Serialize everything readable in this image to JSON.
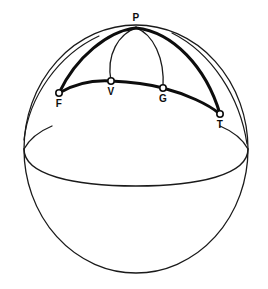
{
  "figure": {
    "type": "geometry-diagram",
    "background_color": "#ffffff",
    "stroke_color": "#1a1a1a",
    "thick_stroke_color": "#0d0d0d",
    "label_color": "#0d0d0d",
    "canvas": {
      "width": 268,
      "height": 289
    }
  },
  "sphere": {
    "center_x": 136,
    "center_y": 149,
    "radius_x": 112,
    "radius_y": 124,
    "outline_stroke_width": 1.3
  },
  "equator": {
    "name": "equator-ellipse",
    "center_x": 136,
    "center_y": 149,
    "semi_major": 112,
    "semi_minor": 36,
    "front_visible": true,
    "back_visible": "stub-only",
    "stroke_width": 1.4
  },
  "points": [
    {
      "id": "P",
      "label": "P",
      "x": 136,
      "y": 28,
      "label_x": 136,
      "label_y": 13,
      "marker": false,
      "role": "pole"
    },
    {
      "id": "F",
      "label": "F",
      "x": 59,
      "y": 93,
      "label_x": 59,
      "label_y": 99,
      "marker": true,
      "role": "vertex"
    },
    {
      "id": "V",
      "label": "V",
      "x": 111,
      "y": 81,
      "label_x": 111,
      "label_y": 87,
      "marker": true,
      "role": "vertex"
    },
    {
      "id": "G",
      "label": "G",
      "x": 163,
      "y": 88,
      "label_x": 163,
      "label_y": 94,
      "marker": true,
      "role": "vertex"
    },
    {
      "id": "T",
      "label": "T",
      "x": 220,
      "y": 114,
      "label_x": 220,
      "label_y": 120,
      "marker": true,
      "role": "vertex"
    }
  ],
  "arcs": [
    {
      "id": "arc-P-F",
      "from": "P",
      "to": "F",
      "weight": "thick",
      "stroke_width": 3.0,
      "path": "M 136 28 C 109 31 77 57 59 93"
    },
    {
      "id": "arc-P-T",
      "from": "P",
      "to": "T",
      "weight": "thick",
      "stroke_width": 3.0,
      "path": "M 136 28 C 172 32 205 66 220 114"
    },
    {
      "id": "arc-P-V",
      "from": "P",
      "to": "V",
      "weight": "thin",
      "stroke_width": 1.3,
      "path": "M 136 28 C 119 34 107 54 111 81"
    },
    {
      "id": "arc-P-G",
      "from": "P",
      "to": "G",
      "weight": "thin",
      "stroke_width": 1.3,
      "path": "M 136 28 C 152 34 164 58 163 88"
    },
    {
      "id": "arc-F-V-G-T",
      "from": "F",
      "to": "T",
      "weight": "thick",
      "stroke_width": 3.0,
      "path": "M 59 93 C 76 83 95 80 111 81 C 133 82 152 85 163 88 C 186 94 208 104 220 114",
      "through": [
        "V",
        "G"
      ]
    }
  ],
  "thin_guides": [
    {
      "id": "guide-left-outer",
      "stroke_width": 1.2,
      "path": "M 24 138 C 29 96 58 55 98 37"
    },
    {
      "id": "guide-right-outer",
      "stroke_width": 1.2,
      "path": "M 172 33 C 212 53 240 96 247 143"
    }
  ],
  "marker": {
    "radius": 3.2,
    "fill": "#ffffff",
    "stroke": "#0d0d0d",
    "stroke_width": 1.6
  }
}
